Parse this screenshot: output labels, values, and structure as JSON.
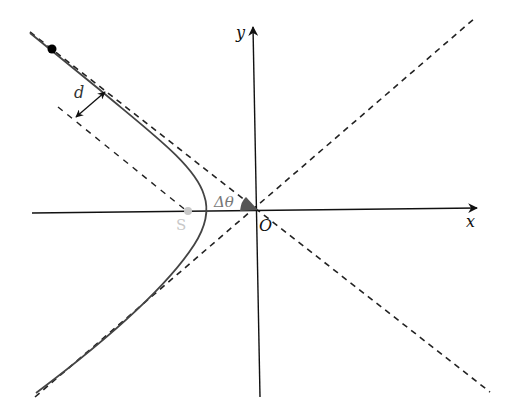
{
  "diagram": {
    "type": "hyperbolic-trajectory",
    "labels": {
      "x_axis": "x",
      "y_axis": "y",
      "origin": "O",
      "impact_parameter": "d",
      "point_s": "S",
      "angle": "Δθ"
    },
    "colors": {
      "axes": "#111111",
      "asymptotes": "#222222",
      "hyperbola": "#444444",
      "point_s": "#c8c8c8",
      "angle_wedge": "#555555",
      "angle_label": "#777777",
      "particle": "#000000"
    },
    "geometry": {
      "origin": [
        258,
        210
      ],
      "x_axis": {
        "from": [
          32,
          213
        ],
        "to": [
          477,
          208
        ]
      },
      "y_axis": {
        "from": [
          260,
          397
        ],
        "to": [
          253,
          27
        ]
      },
      "asymptote_1": {
        "from": [
          30,
          32
        ],
        "to": [
          490,
          392
        ]
      },
      "asymptote_2": {
        "from": [
          35,
          397
        ],
        "to": [
          475,
          18
        ]
      },
      "offset_line": {
        "from": [
          58,
          107
        ],
        "to": [
          188,
          212
        ]
      },
      "hyperbola_vertex": [
        207,
        210
      ],
      "particle": [
        52,
        49
      ],
      "point_s": [
        188,
        211
      ]
    }
  }
}
